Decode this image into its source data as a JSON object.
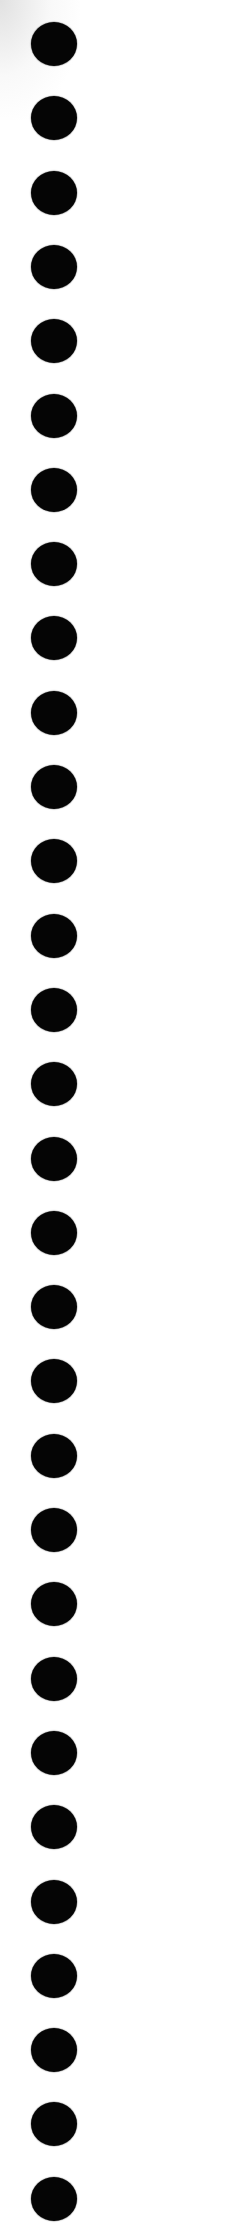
{
  "sheet": {
    "background": "#ffffff",
    "hole_color": "#050505",
    "hole_count": 30,
    "hole_center_x": 54,
    "first_hole_center_y": 44,
    "hole_spacing_y": 74.3,
    "hole_diameter": 46
  }
}
